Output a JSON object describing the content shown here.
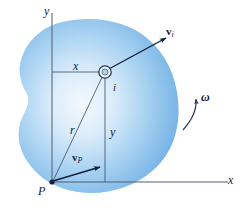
{
  "figure": {
    "body_label": "rigid-body-blob",
    "colors": {
      "body_edge": "#7CB5E8",
      "body_center": "#EAF4FC",
      "line": "#3A4A63",
      "axis": "#555f6e",
      "label": "#14213d",
      "background": "#ffffff"
    }
  },
  "axes": {
    "y_label": "y",
    "x_label": "x",
    "origin_point_label": "P"
  },
  "dimensions": {
    "x_offset_label": "x",
    "y_offset_label": "y",
    "radius_label": "r"
  },
  "particle": {
    "label": "i",
    "marker": "particle-ring-marker"
  },
  "vectors": {
    "v_i": {
      "symbol": "v",
      "subscript": "i"
    },
    "v_p": {
      "symbol": "v",
      "subscript": "P"
    }
  },
  "rotation": {
    "omega_label": "ω",
    "arrow": "curved-ccw-arrow"
  }
}
